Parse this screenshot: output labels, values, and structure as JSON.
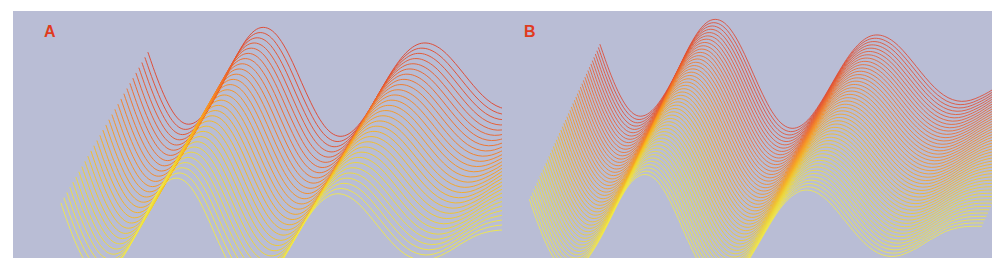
{
  "figure": {
    "background_color": "#ffffff",
    "plot_background_color": "#b9bdd5",
    "width": 1004,
    "height": 272
  },
  "panels": [
    {
      "id": "panel-a",
      "label": "A",
      "label_color": "#e03b1e",
      "n_lines": 30,
      "line_spacing_y": 5.2,
      "line_shear_x": -3.0,
      "line_width": 1.0
    },
    {
      "id": "panel-b",
      "label": "B",
      "label_color": "#e03b1e",
      "n_lines": 48,
      "line_spacing_y": 3.3,
      "line_shear_x": -1.5,
      "line_width": 0.9
    }
  ],
  "colormap": {
    "name": "red-orange-yellow",
    "stops": [
      "#e0472f",
      "#ef6a2a",
      "#f89020",
      "#f7b51e",
      "#efd732",
      "#f0e84a"
    ]
  },
  "chart_data": {
    "type": "line",
    "title": "",
    "subtitle": "",
    "xlabel": "",
    "ylabel": "",
    "grid": false,
    "legend": null,
    "axis_visible": false,
    "tick_labels_x": [],
    "tick_labels_y": [],
    "xlim": [
      0,
      1
    ],
    "ylim": [
      -1.05,
      1.05
    ],
    "x": [
      0.0,
      0.02,
      0.04,
      0.06,
      0.08,
      0.1,
      0.12,
      0.14,
      0.16,
      0.18,
      0.2,
      0.22,
      0.24,
      0.26,
      0.28,
      0.3,
      0.32,
      0.34,
      0.36,
      0.38,
      0.4,
      0.42,
      0.44,
      0.46,
      0.48,
      0.5,
      0.52,
      0.54,
      0.56,
      0.58,
      0.6,
      0.62,
      0.64,
      0.66,
      0.68,
      0.7,
      0.72,
      0.74,
      0.76,
      0.78,
      0.8,
      0.82,
      0.84,
      0.86,
      0.88,
      0.9,
      0.92,
      0.94,
      0.96,
      0.98,
      1.0
    ],
    "series": [
      {
        "name": "damped waveform",
        "color_start": "#e0472f",
        "color_end": "#f0e84a",
        "values": [
          0.56,
          0.12,
          -0.25,
          -0.52,
          -0.66,
          -0.66,
          -0.54,
          -0.33,
          -0.06,
          0.25,
          0.56,
          0.81,
          0.96,
          0.99,
          0.9,
          0.69,
          0.39,
          0.04,
          -0.3,
          -0.59,
          -0.79,
          -0.88,
          -0.86,
          -0.74,
          -0.54,
          -0.29,
          -0.02,
          0.24,
          0.46,
          0.62,
          0.71,
          0.72,
          0.66,
          0.54,
          0.37,
          0.18,
          -0.01,
          -0.18,
          -0.31,
          -0.39,
          -0.42,
          -0.4,
          -0.34,
          -0.26,
          -0.16,
          -0.07,
          0.01,
          0.06,
          0.09,
          0.1,
          0.1
        ]
      }
    ]
  }
}
